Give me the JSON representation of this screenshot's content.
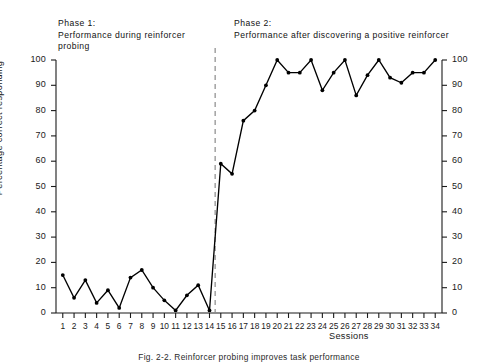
{
  "figure": {
    "caption": "Fig. 2-2.  Reinforcer probing improves task performance",
    "phase1_title": "Phase 1:\nPerformance during reinforcer probing",
    "phase2_title": "Phase 2:\nPerformance after discovering a positive reinforcer"
  },
  "chart_data": {
    "type": "line",
    "title": "",
    "xlabel": "Sessions",
    "ylabel": "Percentage correct responding",
    "xlim": [
      0.4,
      34.6
    ],
    "ylim": [
      0,
      100
    ],
    "yticks": [
      0,
      10,
      20,
      30,
      40,
      50,
      60,
      70,
      80,
      90,
      100
    ],
    "ytick_labels": [
      "0",
      "10",
      "20",
      "30",
      "40",
      "50",
      "60",
      "70",
      "80",
      "90",
      "100"
    ],
    "right_axis_ticks": [
      0,
      10,
      20,
      30,
      40,
      50,
      60,
      70,
      80,
      90,
      100
    ],
    "right_axis_tick_labels": [
      "0",
      "10",
      "20",
      "30",
      "40",
      "50",
      "60",
      "70",
      "80",
      "90",
      "100"
    ],
    "grid": false,
    "legend": "none",
    "marker": "filled-circle",
    "line_color": "#000000",
    "x": [
      1,
      2,
      3,
      4,
      5,
      6,
      7,
      8,
      9,
      10,
      11,
      12,
      13,
      14,
      15,
      16,
      17,
      18,
      19,
      20,
      21,
      22,
      23,
      24,
      25,
      26,
      27,
      28,
      29,
      30,
      31,
      32,
      33,
      34
    ],
    "xtick_labels": [
      "1",
      "2",
      "3",
      "4",
      "5",
      "6",
      "7",
      "8",
      "9",
      "10",
      "11",
      "12",
      "13",
      "14",
      "15",
      "16",
      "17",
      "18",
      "19",
      "20",
      "21",
      "22",
      "23",
      "24",
      "25",
      "26",
      "27",
      "28",
      "29",
      "30",
      "31",
      "32",
      "33",
      "34"
    ],
    "series": [
      {
        "name": "Percentage correct responding",
        "values": [
          15,
          6,
          13,
          4,
          9,
          2,
          14,
          17,
          10,
          5,
          1,
          7,
          11,
          1,
          59,
          55,
          76,
          80,
          90,
          100,
          95,
          95,
          100,
          88,
          95,
          100,
          86,
          94,
          100,
          93,
          91,
          95,
          95,
          100
        ]
      }
    ],
    "annotations": [
      {
        "type": "vertical-dashed-line",
        "name": "phase-divider",
        "x": 14.5,
        "color": "#8a8a8a",
        "label": ""
      }
    ],
    "phases": [
      {
        "name": "Phase 1",
        "sessions": [
          1,
          14
        ],
        "description": "Performance during reinforcer probing"
      },
      {
        "name": "Phase 2",
        "sessions": [
          15,
          34
        ],
        "description": "Performance after discovering a positive reinforcer"
      }
    ]
  }
}
